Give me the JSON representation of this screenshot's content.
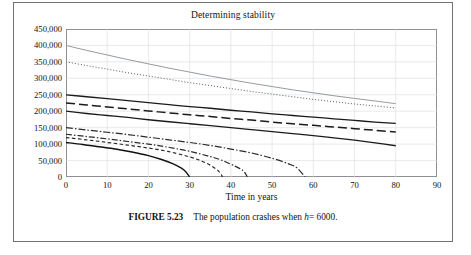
{
  "figure": {
    "caption_label": "FIGURE 5.23",
    "caption_text_before": "The population crashes when",
    "caption_var": "h",
    "caption_eq": "= 6000."
  },
  "chart_data": {
    "type": "line",
    "title": "Determining stability",
    "xlabel": "Time in years",
    "ylabel": "",
    "xlim": [
      0,
      90
    ],
    "ylim": [
      0,
      450000
    ],
    "xticks": [
      0,
      10,
      20,
      30,
      40,
      50,
      60,
      70,
      80,
      90
    ],
    "xtick_labels": [
      "0",
      "10",
      "20",
      "30",
      "40",
      "50",
      "60",
      "70",
      "80",
      "90"
    ],
    "yticks": [
      0,
      50000,
      100000,
      150000,
      200000,
      250000,
      300000,
      350000,
      400000,
      450000
    ],
    "ytick_labels": [
      "0",
      "50,000",
      "100,000",
      "150,000",
      "200,000",
      "250,000",
      "300,000",
      "350,000",
      "400,000",
      "450,000"
    ],
    "grid": true,
    "grid_color": "#d9dcdf",
    "legend": "none",
    "series": [
      {
        "name": "P0 = 400000",
        "style": "solid-thin",
        "color": "#8a8f93",
        "width": 0.9,
        "dash": "none",
        "x": [
          0,
          5,
          10,
          15,
          20,
          25,
          30,
          35,
          40,
          45,
          50,
          55,
          60,
          65,
          70,
          75,
          80
        ],
        "y": [
          400000,
          385000,
          371000,
          357000,
          344000,
          331000,
          319000,
          307000,
          296000,
          285000,
          275000,
          265000,
          256000,
          247000,
          239000,
          231000,
          223000
        ]
      },
      {
        "name": "P0 = 350000",
        "style": "dotted",
        "color": "#55595d",
        "width": 1.0,
        "dash": "1,2",
        "x": [
          0,
          5,
          10,
          15,
          20,
          25,
          30,
          35,
          40,
          45,
          50,
          55,
          60,
          65,
          70,
          75,
          80
        ],
        "y": [
          350000,
          339000,
          328000,
          317000,
          307000,
          297000,
          287000,
          278000,
          269000,
          260000,
          252000,
          244000,
          236000,
          229000,
          222000,
          216000,
          210000
        ]
      },
      {
        "name": "P0 = 250000",
        "style": "solid",
        "color": "#1b1b1b",
        "width": 1.3,
        "dash": "none",
        "x": [
          0,
          5,
          10,
          15,
          20,
          25,
          30,
          35,
          40,
          45,
          50,
          55,
          60,
          65,
          70,
          75,
          80
        ],
        "y": [
          250000,
          244000,
          238000,
          232000,
          226000,
          220000,
          214000,
          209000,
          203000,
          198000,
          192000,
          187000,
          182000,
          177000,
          172000,
          167000,
          163000
        ]
      },
      {
        "name": "P0 = 225000",
        "style": "dashed-long",
        "color": "#1b1b1b",
        "width": 1.5,
        "dash": "9,4",
        "x": [
          0,
          5,
          10,
          15,
          20,
          25,
          30,
          35,
          40,
          45,
          50,
          55,
          60,
          65,
          70,
          75,
          80
        ],
        "y": [
          225000,
          219000,
          213000,
          207000,
          201000,
          195000,
          189000,
          184000,
          178000,
          173000,
          167000,
          162000,
          157000,
          152000,
          147000,
          142000,
          137000
        ]
      },
      {
        "name": "P0 = 200000",
        "style": "solid",
        "color": "#1b1b1b",
        "width": 1.3,
        "dash": "none",
        "x": [
          0,
          5,
          10,
          15,
          20,
          25,
          30,
          35,
          40,
          45,
          50,
          55,
          60,
          65,
          70,
          75,
          80
        ],
        "y": [
          200000,
          193000,
          187000,
          181000,
          174000,
          168000,
          162000,
          156000,
          150000,
          144000,
          138000,
          132000,
          126000,
          119000,
          112000,
          104000,
          95000
        ]
      },
      {
        "name": "P0 = 150000 (crashes at t = 58)",
        "style": "dash-dot",
        "color": "#2a2a2a",
        "width": 1.2,
        "dash": "7,2,1.5,2",
        "x": [
          0,
          5,
          10,
          15,
          20,
          25,
          30,
          35,
          40,
          45,
          50,
          54,
          56,
          58
        ],
        "y": [
          150000,
          143000,
          136000,
          129000,
          121000,
          113000,
          105000,
          96000,
          85000,
          73000,
          57000,
          40000,
          28000,
          0
        ]
      },
      {
        "name": "P0 = 130000 (crashes at t = 44)",
        "style": "dash-dot",
        "color": "#2a2a2a",
        "width": 1.2,
        "dash": "6,2,1.5,2",
        "x": [
          0,
          5,
          10,
          15,
          20,
          25,
          30,
          35,
          38,
          41,
          43,
          44
        ],
        "y": [
          130000,
          123000,
          116000,
          108000,
          100000,
          90000,
          78000,
          62000,
          50000,
          33000,
          19000,
          0
        ]
      },
      {
        "name": "P0 = 120000 (crashes at t = 38)",
        "style": "dashed-short",
        "color": "#2a2a2a",
        "width": 1.2,
        "dash": "3.5,2.5",
        "x": [
          0,
          5,
          10,
          15,
          20,
          25,
          30,
          33,
          35,
          37,
          38
        ],
        "y": [
          120000,
          113000,
          105000,
          97000,
          88000,
          77000,
          61000,
          48000,
          36000,
          18000,
          0
        ]
      },
      {
        "name": "P0 = 105000 (crashes at t = 30)",
        "style": "solid",
        "color": "#111111",
        "width": 1.4,
        "dash": "none",
        "x": [
          0,
          4,
          8,
          12,
          16,
          20,
          23,
          26,
          28,
          29,
          30
        ],
        "y": [
          105000,
          99000,
          92000,
          85000,
          76000,
          65000,
          54000,
          40000,
          27000,
          17000,
          0
        ]
      }
    ]
  }
}
